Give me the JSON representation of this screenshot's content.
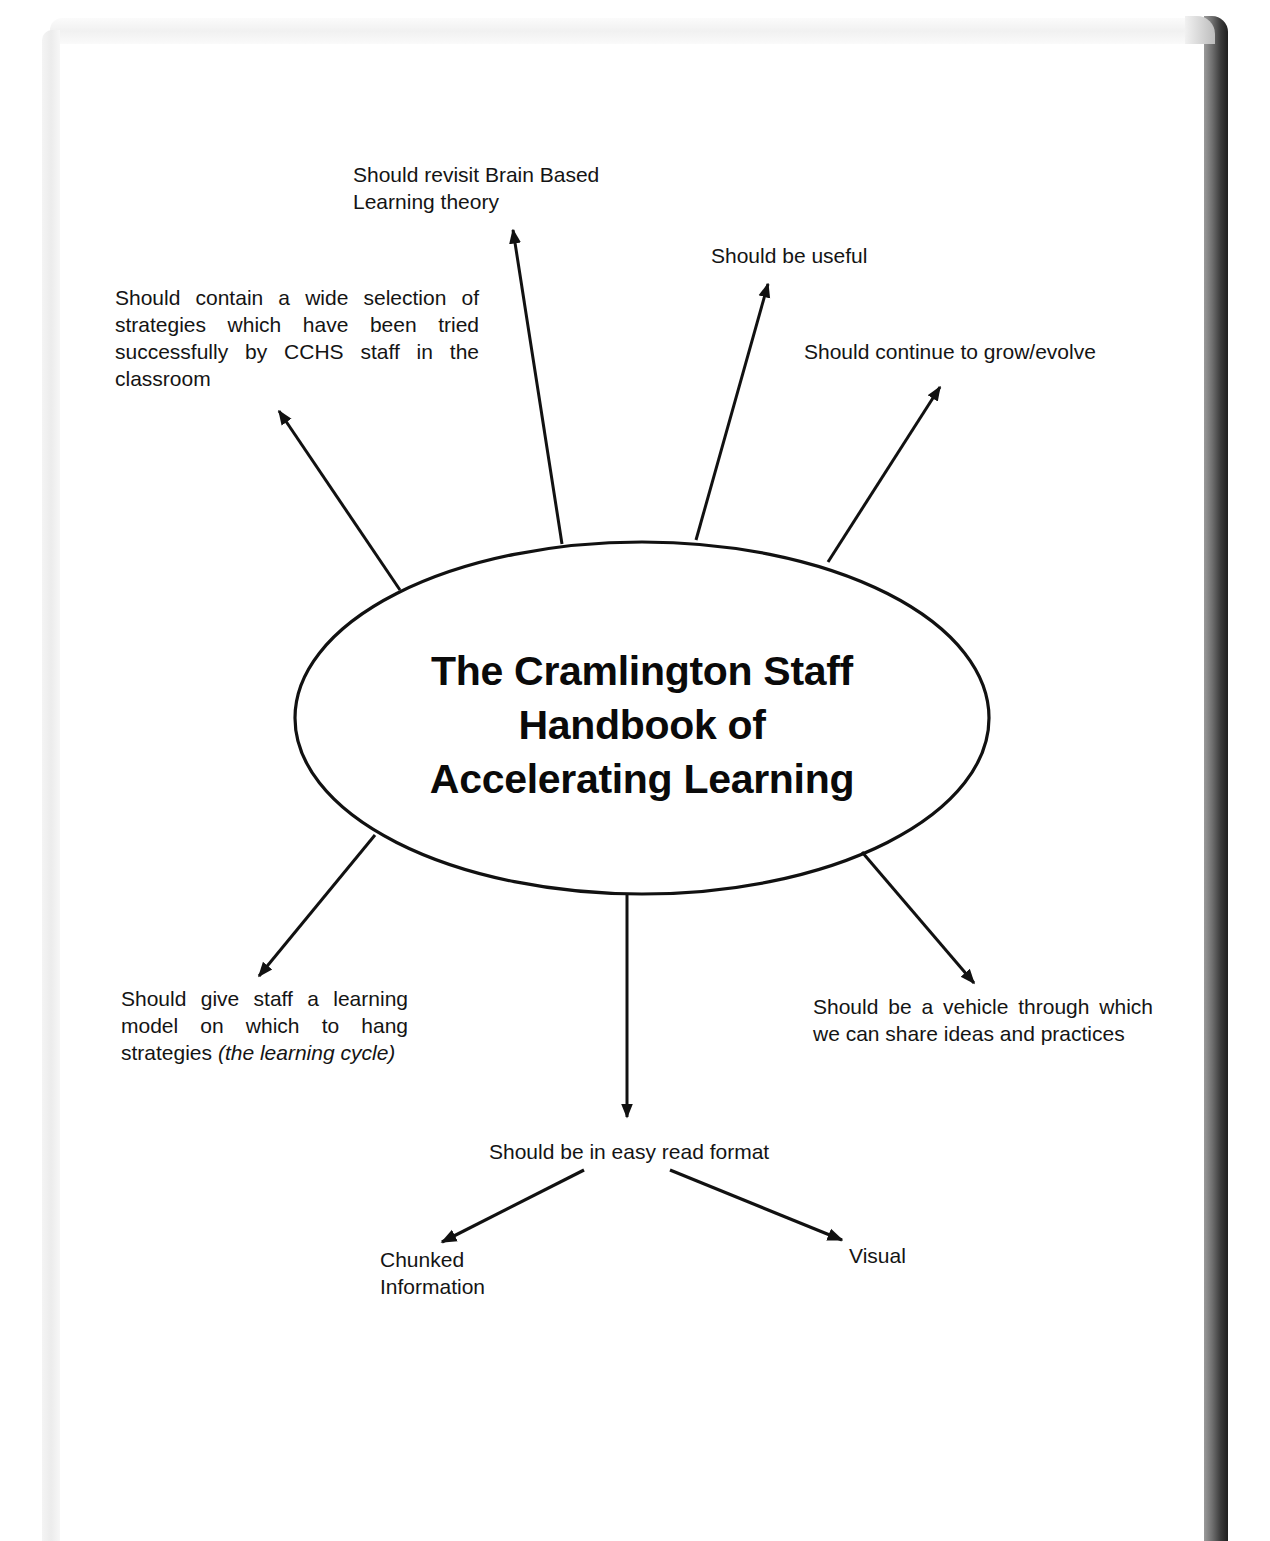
{
  "document": {
    "type": "mind-map",
    "central_topic": {
      "lines": [
        "The Cramlington Staff",
        "Handbook of",
        "Accelerating Learning"
      ]
    },
    "branches": [
      {
        "id": "strategies",
        "text": "Should contain a wide selection of strategies which have been tried successfully by CCHS staff in the classroom"
      },
      {
        "id": "brain",
        "text": "Should revisit Brain Based Learning theory"
      },
      {
        "id": "useful",
        "text": "Should be useful"
      },
      {
        "id": "grow",
        "text": "Should continue to grow/evolve"
      },
      {
        "id": "learning_model",
        "text_plain": "Should give staff a learning model on which to hang strategies",
        "text_italic": "(the learning cycle)"
      },
      {
        "id": "easy_read",
        "text": "Should be in easy read format",
        "children": [
          {
            "id": "chunked",
            "text": "Chunked Information"
          },
          {
            "id": "visual",
            "text": "Visual"
          }
        ]
      },
      {
        "id": "vehicle",
        "text": "Should be a vehicle through which we can share ideas and practices"
      }
    ]
  },
  "colors": {
    "ink": "#111111",
    "page": "#ffffff",
    "shadow_right": "#2a2a2a",
    "shadow_left": "#ececec"
  },
  "arrow_icons": {
    "arrowhead": "triangle-arrowhead"
  }
}
